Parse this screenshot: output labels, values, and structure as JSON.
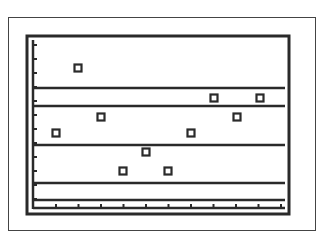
{
  "chart_data": {
    "type": "scatter",
    "title": "",
    "xlabel": "",
    "ylabel": "",
    "grid": false,
    "legend": null,
    "x": [
      1,
      2,
      3,
      4,
      5,
      6,
      7,
      8,
      9,
      10
    ],
    "y": [
      7.5,
      10.5,
      8.3,
      5.8,
      6.7,
      5.8,
      7.5,
      9.2,
      8.3,
      9.2
    ],
    "points_px": [
      [
        56,
        133
      ],
      [
        78,
        68
      ],
      [
        101,
        117
      ],
      [
        123,
        171
      ],
      [
        146,
        152
      ],
      [
        168,
        171
      ],
      [
        191,
        133
      ],
      [
        214,
        98
      ],
      [
        237,
        117
      ],
      [
        260,
        98
      ]
    ],
    "hlines_px": [
      88,
      106,
      145,
      183,
      200
    ],
    "x_ticks": 11,
    "y_ticks": 12,
    "colors": {
      "ink": "#2a2a2a",
      "frame": "#444444",
      "background": "#ffffff"
    }
  }
}
